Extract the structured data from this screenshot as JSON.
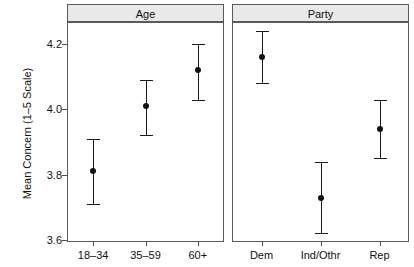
{
  "chart_data": {
    "type": "scatter",
    "title": "",
    "xlabel": "",
    "ylabel": "Mean Concern (1–5 Scale)",
    "ylim": [
      3.6,
      4.28
    ],
    "yticks": [
      4.2,
      4.0,
      3.8,
      3.6
    ],
    "ytick_labels": [
      "4.2",
      "4.0",
      "3.8",
      "3.6"
    ],
    "grid": false,
    "legend": "none",
    "error_bars": "95% confidence interval",
    "panels": [
      {
        "strip_label": "Age",
        "categories": [
          "18–34",
          "35–59",
          "60+"
        ],
        "values": [
          3.81,
          4.01,
          4.12
        ],
        "ci_lower": [
          3.71,
          3.92,
          4.03
        ],
        "ci_upper": [
          3.91,
          4.09,
          4.2
        ]
      },
      {
        "strip_label": "Party",
        "categories": [
          "Dem",
          "Ind/Othr",
          "Rep"
        ],
        "values": [
          4.16,
          3.73,
          3.94
        ],
        "ci_lower": [
          4.08,
          3.62,
          3.85
        ],
        "ci_upper": [
          4.24,
          3.84,
          4.03
        ]
      }
    ],
    "colors": {
      "point": "#111111",
      "errorbar": "#1a1a1a",
      "strip_fill": "#e9e9e9",
      "panel_border": "#5a5a5a",
      "background": "#ffffff"
    }
  }
}
